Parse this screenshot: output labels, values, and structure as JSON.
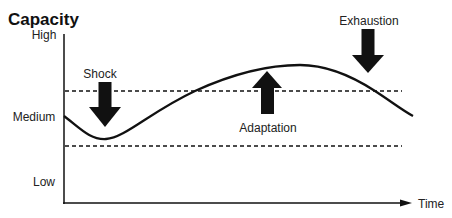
{
  "diagram": {
    "title": "Capacity",
    "y_axis": {
      "levels": [
        {
          "label": "High",
          "y": 35
        },
        {
          "label": "Medium",
          "y": 120
        },
        {
          "label": "Low",
          "y": 184
        }
      ]
    },
    "x_axis": {
      "label": "Time"
    },
    "thresholds": [
      {
        "name": "upper-threshold",
        "y": 91,
        "style": "dashed"
      },
      {
        "name": "lower-threshold",
        "y": 146,
        "style": "dashed"
      }
    ],
    "events": [
      {
        "label": "Shock",
        "direction": "down"
      },
      {
        "label": "Adaptation",
        "direction": "up"
      },
      {
        "label": "Exhaustion",
        "direction": "down"
      }
    ],
    "colors": {
      "ink": "#111111",
      "background": "#ffffff"
    }
  }
}
